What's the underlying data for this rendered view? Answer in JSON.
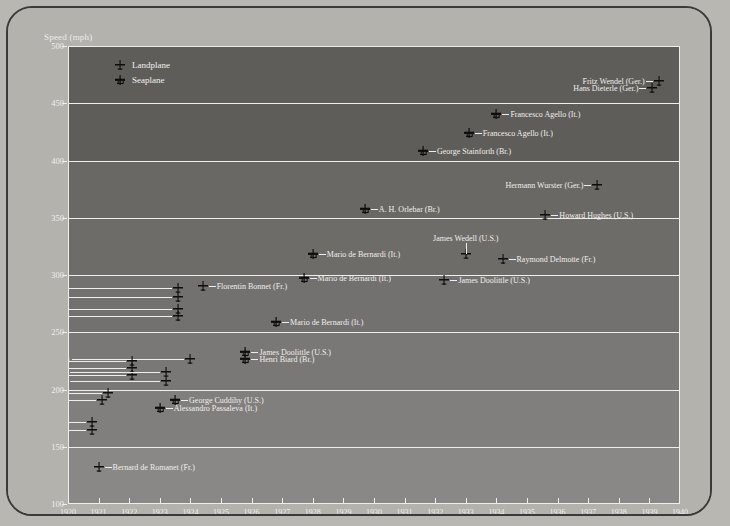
{
  "chart_data": {
    "type": "scatter",
    "title": "",
    "ylabel": "Speed (mph)",
    "xlabel": "",
    "ylim": [
      100,
      500
    ],
    "xlim": [
      1920,
      1940
    ],
    "yticks": [
      500,
      450,
      400,
      350,
      300,
      250,
      200,
      150,
      100
    ],
    "xticks": [
      1920,
      1921,
      1922,
      1923,
      1924,
      1925,
      1926,
      1927,
      1928,
      1929,
      1930,
      1931,
      1932,
      1933,
      1934,
      1935,
      1936,
      1937,
      1938,
      1939,
      1940
    ],
    "grid": "horizontal-bands",
    "legend": {
      "position": "top-left",
      "entries": [
        {
          "key": "landplane",
          "label": "Landplane",
          "marker": "landplane-icon"
        },
        {
          "key": "seaplane",
          "label": "Seaplane",
          "marker": "seaplane-icon"
        }
      ]
    },
    "points": [
      {
        "name": "Fritz Wendel (Ger.)",
        "year": 1939.3,
        "speed": 469,
        "type": "landplane",
        "side": "left"
      },
      {
        "name": "Hans Dieterle (Ger.)",
        "year": 1939.1,
        "speed": 463,
        "type": "landplane",
        "side": "left"
      },
      {
        "name": "Francesco Agello (It.)",
        "year": 1934.0,
        "speed": 441,
        "type": "seaplane",
        "side": "right"
      },
      {
        "name": "Francesco Agello (It.)",
        "year": 1933.1,
        "speed": 424,
        "type": "seaplane",
        "side": "right"
      },
      {
        "name": "George Stainforth (Br.)",
        "year": 1931.6,
        "speed": 408,
        "type": "seaplane",
        "side": "right"
      },
      {
        "name": "Hermann Wurster (Ger.)",
        "year": 1937.3,
        "speed": 379,
        "type": "landplane",
        "side": "left"
      },
      {
        "name": "A. H. Orlebar (Br.)",
        "year": 1929.7,
        "speed": 358,
        "type": "seaplane",
        "side": "right"
      },
      {
        "name": "Howard Hughes (U.S.)",
        "year": 1935.6,
        "speed": 352,
        "type": "landplane",
        "side": "right"
      },
      {
        "name": "James Wedell (U.S.)",
        "year": 1933.0,
        "speed": 318,
        "type": "landplane",
        "side": "above"
      },
      {
        "name": "Mario de Bernardi (It.)",
        "year": 1928.0,
        "speed": 318,
        "type": "seaplane",
        "side": "right"
      },
      {
        "name": "Raymond Delmotte (Fr.)",
        "year": 1934.2,
        "speed": 314,
        "type": "landplane",
        "side": "right"
      },
      {
        "name": "Mario de Bernardi (It.)",
        "year": 1927.7,
        "speed": 297,
        "type": "seaplane",
        "side": "right"
      },
      {
        "name": "James Doolittle (U.S.)",
        "year": 1932.3,
        "speed": 296,
        "type": "landplane",
        "side": "right"
      },
      {
        "name": "Florentin Bonnet (Fr.)",
        "year": 1924.4,
        "speed": 290,
        "type": "landplane",
        "side": "right"
      },
      {
        "name": "Alford Williams (U.S.)",
        "year": 1923.6,
        "speed": 289,
        "type": "landplane",
        "side": "leader-left"
      },
      {
        "name": "Harold Brow (U.S.)",
        "year": 1923.6,
        "speed": 281,
        "type": "landplane",
        "side": "leader-left"
      },
      {
        "name": "Russell Maughan (U.S.)",
        "year": 1923.6,
        "speed": 270,
        "type": "landplane",
        "side": "leader-left"
      },
      {
        "name": "William Mitchell (U.S.)",
        "year": 1923.6,
        "speed": 264,
        "type": "landplane",
        "side": "leader-left"
      },
      {
        "name": "Mario de Bernardi (It.)",
        "year": 1926.8,
        "speed": 259,
        "type": "seaplane",
        "side": "right"
      },
      {
        "name": "James Doolittle (U.S.)",
        "year": 1925.8,
        "speed": 233,
        "type": "seaplane",
        "side": "right"
      },
      {
        "name": "Sadi Lecointe (Fr.)",
        "year": 1924.0,
        "speed": 227,
        "type": "landplane",
        "side": "leader-left"
      },
      {
        "name": "Henri Biard (Br.)",
        "year": 1925.8,
        "speed": 227,
        "type": "seaplane",
        "side": "right"
      },
      {
        "name": "Sadi Lecointe (Fr.)",
        "year": 1922.1,
        "speed": 225,
        "type": "landplane",
        "side": "leader-left"
      },
      {
        "name": "Jean Casale (Fr.)",
        "year": 1922.1,
        "speed": 219,
        "type": "landplane",
        "side": "leader-left"
      },
      {
        "name": "Bernard de Romanet (Fr.)",
        "year": 1922.1,
        "speed": 213,
        "type": "landplane",
        "side": "leader-left"
      },
      {
        "name": "Sadi Lecointe (Fr.)",
        "year": 1923.2,
        "speed": 215,
        "type": "landplane",
        "side": "leader-left"
      },
      {
        "name": "Sadi Lecointe (Fr.)",
        "year": 1923.2,
        "speed": 207,
        "type": "landplane",
        "side": "leader-left"
      },
      {
        "name": "Sadi Lecointe (Fr.)",
        "year": 1921.3,
        "speed": 197,
        "type": "landplane",
        "side": "leader-left"
      },
      {
        "name": "Bernard de Romanet (Fr.)",
        "year": 1921.1,
        "speed": 191,
        "type": "landplane",
        "side": "leader-left"
      },
      {
        "name": "George Cuddihy (U.S.)",
        "year": 1923.5,
        "speed": 191,
        "type": "seaplane",
        "side": "right"
      },
      {
        "name": "Alessandro Passaleva (It.)",
        "year": 1923.0,
        "speed": 184,
        "type": "seaplane",
        "side": "right"
      },
      {
        "name": "Sadi Lecointe (Fr.)",
        "year": 1920.8,
        "speed": 172,
        "type": "landplane",
        "side": "leader-left"
      },
      {
        "name": "Sadi Lecointe (Fr.)",
        "year": 1920.8,
        "speed": 165,
        "type": "landplane",
        "side": "leader-left"
      },
      {
        "name": "Bernard de Romanet (Fr.)",
        "year": 1921.0,
        "speed": 132,
        "type": "landplane",
        "side": "right"
      }
    ]
  },
  "axes": {
    "y_title": "Speed (mph)",
    "y_labels": [
      "500",
      "450",
      "400",
      "350",
      "300",
      "250",
      "200",
      "150",
      "100"
    ],
    "x_labels": [
      "1920",
      "1921",
      "1922",
      "1923",
      "1924",
      "1925",
      "1926",
      "1927",
      "1928",
      "1929",
      "1930",
      "1931",
      "1932",
      "1933",
      "1934",
      "1935",
      "1936",
      "1937",
      "1938",
      "1939",
      "1940"
    ]
  },
  "legend": {
    "landplane_label": "Landplane",
    "seaplane_label": "Seaplane"
  },
  "colors": {
    "page_background": "#b9b7b2",
    "plot_background": "#6e6c68",
    "gridline": "#efeeec",
    "text": "#efeeec",
    "marker": "#111111"
  }
}
